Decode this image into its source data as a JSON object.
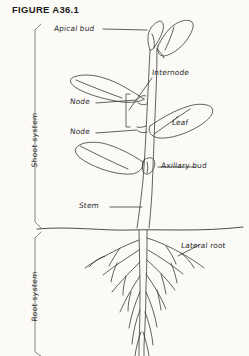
{
  "figure": {
    "caption": "FIGURE A36.1",
    "background_color": "#fbfaf7",
    "ink_color": "#2a2a2a",
    "width": 249,
    "height": 356
  },
  "systems": [
    {
      "id": "shoot",
      "label": "Shoot system"
    },
    {
      "id": "root",
      "label": "Root system"
    }
  ],
  "labels": {
    "apical_bud": "Apical bud",
    "internode": "Internode",
    "node_upper": "Node",
    "node_lower": "Node",
    "leaf": "Leaf",
    "axillary_bud": "Axillary bud",
    "stem": "Stem",
    "lateral_root": "Lateral root"
  },
  "diagram": {
    "soil_line_y": 228,
    "parts": [
      "apical-bud",
      "internode",
      "node",
      "leaf",
      "axillary-bud",
      "stem",
      "lateral-root",
      "taproot"
    ]
  }
}
